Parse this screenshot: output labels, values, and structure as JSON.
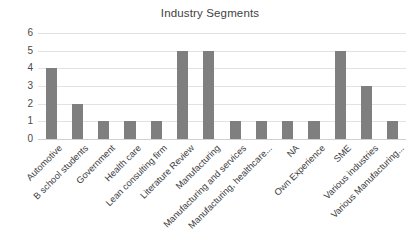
{
  "chart": {
    "title": "Industry Segments"
  },
  "chart_data": {
    "type": "bar",
    "title": "Industry Segments",
    "xlabel": "",
    "ylabel": "",
    "ylim": [
      0,
      6
    ],
    "yticks": [
      0,
      1,
      2,
      3,
      4,
      5,
      6
    ],
    "grid": true,
    "legend": false,
    "bar_color": "#7f7f7f",
    "gridline_color": "#e2e2e2",
    "categories": [
      "Automotive",
      "B school students",
      "Government",
      "Health care",
      "Lean consulting firm",
      "Literature Review",
      "Manufacturing",
      "Manufacturing and services",
      "Manufacturing, healthcare...",
      "NA",
      "Own Experience",
      "SME",
      "Various industries",
      "Various Manufacturing..."
    ],
    "values": [
      4,
      2,
      1,
      1,
      1,
      5,
      5,
      1,
      1,
      1,
      1,
      5,
      3,
      1
    ]
  }
}
